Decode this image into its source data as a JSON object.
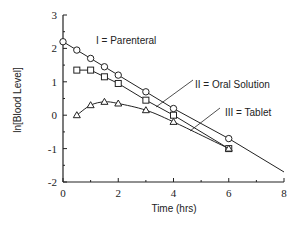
{
  "chart_data": {
    "type": "line",
    "title": "",
    "xlabel": "Time (hrs)",
    "ylabel": "ln[Blood Level]",
    "xlim": [
      0,
      8
    ],
    "ylim": [
      -2,
      3
    ],
    "xticks": [
      0,
      2,
      4,
      6,
      8
    ],
    "yticks": [
      -2,
      -1,
      0,
      1,
      2,
      3
    ],
    "grid": false,
    "legend_position": "inline annotations with leader lines",
    "series": [
      {
        "name": "I = Parenteral",
        "marker": "circle",
        "x": [
          0,
          0.5,
          1,
          1.5,
          2,
          3,
          4,
          6
        ],
        "y": [
          2.2,
          1.95,
          1.7,
          1.45,
          1.2,
          0.7,
          0.2,
          -0.7
        ],
        "fit_line_to": [
          8,
          -1.7
        ]
      },
      {
        "name": "II = Oral Solution",
        "marker": "square",
        "x": [
          0.5,
          1,
          1.5,
          2,
          3,
          4,
          6
        ],
        "y": [
          1.35,
          1.35,
          1.15,
          0.95,
          0.45,
          0.0,
          -1.0
        ]
      },
      {
        "name": "III = Tablet",
        "marker": "triangle",
        "x": [
          0.5,
          1,
          1.5,
          2,
          3,
          4,
          6
        ],
        "y": [
          0.0,
          0.3,
          0.4,
          0.35,
          0.15,
          -0.2,
          -1.0
        ]
      }
    ]
  },
  "labels": {
    "series1": "I = Parenteral",
    "series2": "II = Oral Solution",
    "series3": "III = Tablet",
    "xlabel": "Time (hrs)",
    "ylabel": "ln[Blood Level]",
    "xticks": [
      "0",
      "2",
      "4",
      "6",
      "8"
    ],
    "yticks": [
      "3",
      "2",
      "1",
      "0",
      "-1",
      "-2"
    ]
  }
}
